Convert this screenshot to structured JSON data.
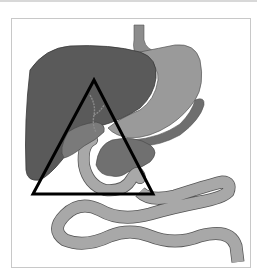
{
  "figure": {
    "colors": {
      "background": "#ffffff",
      "frame_border": "#c8c8c8",
      "liver": "#5a5a5a",
      "stomach": "#8c8c8c",
      "intestine": "#a8a8a8",
      "pancreas": "#707070",
      "outline": "#3a3a3a",
      "triangle": "#000000"
    },
    "triangle": {
      "points": [
        [
          94,
          80
        ],
        [
          33,
          194
        ],
        [
          153,
          194
        ]
      ],
      "stroke_width": 3
    }
  }
}
